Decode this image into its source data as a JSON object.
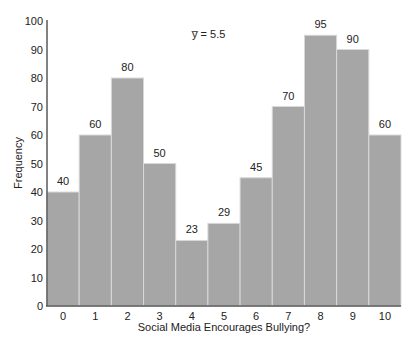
{
  "chart_data": {
    "type": "bar",
    "title": "",
    "annotation": "y̅ = 5.5",
    "xlabel": "Social Media Encourages Bullying?",
    "ylabel": "Frequency",
    "categories": [
      "0",
      "1",
      "2",
      "3",
      "4",
      "5",
      "6",
      "7",
      "8",
      "9",
      "10"
    ],
    "values": [
      40,
      60,
      80,
      50,
      23,
      29,
      45,
      70,
      95,
      90,
      60
    ],
    "ylim": [
      0,
      100
    ],
    "yticks": [
      0,
      10,
      20,
      30,
      40,
      50,
      60,
      70,
      80,
      90,
      100
    ],
    "grid": false,
    "legend": null,
    "bar_color": "#a6a6a6",
    "bar_edge_color": "#d9d9d9",
    "axis_color": "#595959"
  }
}
